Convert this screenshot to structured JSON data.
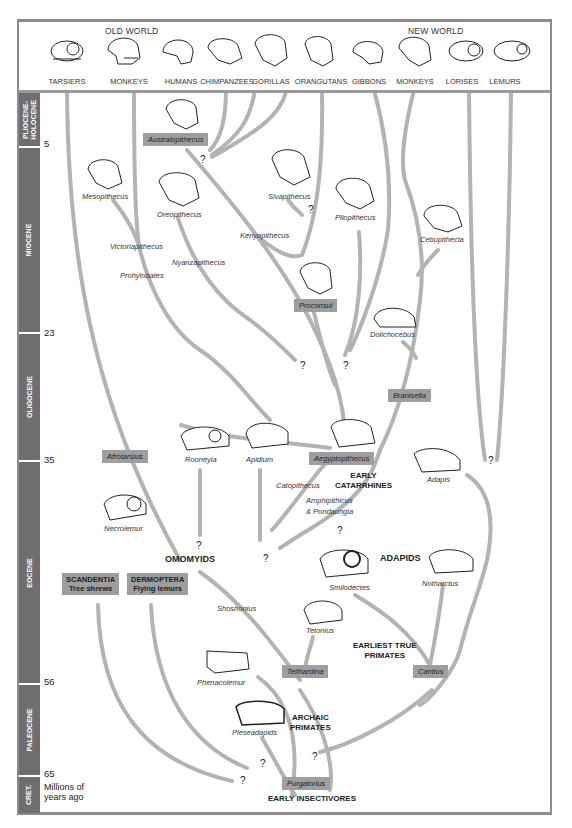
{
  "header": {
    "groups": {
      "old_world": "OLD WORLD",
      "new_world": "NEW WORLD"
    },
    "taxa": [
      "TARSIERS",
      "MONKEYS",
      "HUMANS",
      "CHIMPANZEES",
      "GORILLAS",
      "ORANGUTANS",
      "GIBBONS",
      "MONKEYS",
      "LORISES",
      "LEMURS"
    ]
  },
  "axis": {
    "epochs": [
      "PLIOCENE-\nHOLOCENE",
      "MIOCENE",
      "OLIGOCENE",
      "EOCENE",
      "PALEOCENE",
      "CRET."
    ],
    "ticks": [
      "5",
      "23",
      "35",
      "56",
      "65"
    ],
    "unit_label_1": "Millions of",
    "unit_label_2": "years ago"
  },
  "fossils": {
    "australopithecus": "Australopithecus",
    "mesopithecus": "Mesopithecus",
    "oreopithecus": "Oreopithecus",
    "sivapithecus": "Sivapithecus",
    "pliopithecus": "Pliopithecus",
    "kenyapithecus": "Kenyapithecus",
    "cebupithecia": "Cebupithecia",
    "victoriapithecus": "Victoriapithecus",
    "nyanzapithecus": "Nyanzapithecus",
    "prohylobates": "Prohylobates",
    "proconsul": "Proconsul",
    "dolichocebus": "Dolichocebus",
    "branisella": "Branisella",
    "afrotarsius": "Afrotarsius",
    "rooneyia": "Rooneyia",
    "apidium": "Apidium",
    "aegyptopithecus": "Aegyptopithecus",
    "adapis": "Adapis",
    "catopithecus": "Catopithecus",
    "amphipithicus": "Amphipithicus",
    "pondaungia": "& Pondaungia",
    "necrolemur": "Necrolemur",
    "smilodectes": "Smilodectes",
    "notharctus": "Notharctus",
    "shoshonius": "Shoshonius",
    "tetonius": "Tetonius",
    "teilhardina": "Teilhardina",
    "cantius": "Cantius",
    "phenacolemur": "Phenacolemur",
    "pleseadapids": "Pleseadapids",
    "purgatorius": "Purgatorius"
  },
  "groups": {
    "early_catarrhines_1": "EARLY",
    "early_catarrhines_2": "CATARRHINES",
    "omomyids": "OMOMYIDS",
    "adapids": "ADAPIDS",
    "earliest_true_1": "EARLIEST TRUE",
    "earliest_true_2": "PRIMATES",
    "archaic_1": "ARCHAIC",
    "archaic_2": "PRIMATES",
    "early_insectivores": "EARLY INSECTIVORES",
    "scandentia": "SCANDENTIA",
    "scandentia_common": "Tree shrews",
    "dermoptera": "DERMOPTERA",
    "dermoptera_common": "Flying lemurs"
  },
  "unknown_mark": "?",
  "colors": {
    "branch": "#b3b3b3",
    "box": "#9e9e9e",
    "axis": "#6e6e6e",
    "frame": "#8c8c8c"
  }
}
